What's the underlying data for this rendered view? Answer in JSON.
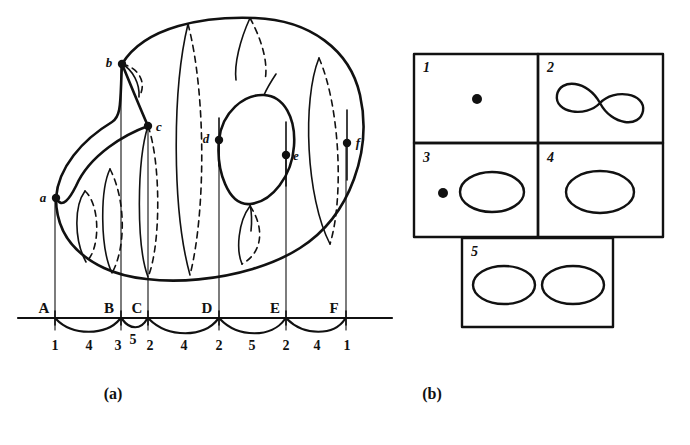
{
  "figure": {
    "panels": [
      {
        "id": "a",
        "caption": "(a)",
        "caption_x": 113,
        "caption_y": 399
      },
      {
        "id": "b",
        "caption": "(b)",
        "caption_x": 432,
        "caption_y": 399
      }
    ]
  },
  "panel_a": {
    "description": "Morse-theory height/height-function diagram of a genus-2 surface with critical points a-f projected onto a horizontal axis divided into intervals A-F.",
    "critical_points": [
      {
        "label": "a",
        "x": 56,
        "y": 198,
        "label_dx": -13,
        "label_dy": 4
      },
      {
        "label": "b",
        "x": 122,
        "y": 64,
        "label_dx": -13,
        "label_dy": 3
      },
      {
        "label": "c",
        "x": 148,
        "y": 126,
        "label_dx": 8,
        "label_dy": 5
      },
      {
        "label": "d",
        "x": 219,
        "y": 140,
        "label_dx": -13,
        "label_dy": 3
      },
      {
        "label": "e",
        "x": 286,
        "y": 155,
        "label_dx": 7,
        "label_dy": 5
      },
      {
        "label": "f",
        "x": 347,
        "y": 143,
        "label_dx": 8,
        "label_dy": 4
      }
    ],
    "axis": {
      "y": 318,
      "x_start": 18,
      "x_end": 392,
      "tick_labels": [
        {
          "text": "A",
          "x": 44,
          "y": 312
        },
        {
          "text": "B",
          "x": 109,
          "y": 312
        },
        {
          "text": "C",
          "x": 153,
          "y": 312
        },
        {
          "text": "D",
          "x": 207,
          "y": 312
        },
        {
          "text": "E",
          "x": 274,
          "y": 312
        },
        {
          "text": "F",
          "x": 334,
          "y": 312
        }
      ],
      "tick_x": [
        55,
        121,
        148,
        219,
        286,
        346
      ],
      "interval_numbers": [
        {
          "text": "1",
          "x": 55,
          "y": 346
        },
        {
          "text": "4",
          "x": 88,
          "y": 346
        },
        {
          "text": "3",
          "x": 118,
          "y": 346
        },
        {
          "text": "5",
          "x": 133,
          "y": 341
        },
        {
          "text": "2",
          "x": 150,
          "y": 346
        },
        {
          "text": "4",
          "x": 184,
          "y": 346
        },
        {
          "text": "2",
          "x": 219,
          "y": 346
        },
        {
          "text": "5",
          "x": 252,
          "y": 346
        },
        {
          "text": "2",
          "x": 286,
          "y": 346
        },
        {
          "text": "4",
          "x": 316,
          "y": 346
        },
        {
          "text": "1",
          "x": 347,
          "y": 346
        }
      ]
    }
  },
  "panel_b": {
    "description": "Table of the five level-set topology types referenced by the interval numbers in panel (a).",
    "cells": [
      {
        "number": "1",
        "type": "point",
        "x": 414,
        "y": 54,
        "w": 124,
        "h": 89
      },
      {
        "number": "2",
        "type": "figure-eight",
        "x": 538,
        "y": 54,
        "w": 125,
        "h": 89
      },
      {
        "number": "3",
        "type": "point-and-circle",
        "x": 414,
        "y": 143,
        "w": 124,
        "h": 94
      },
      {
        "number": "4",
        "type": "circle",
        "x": 538,
        "y": 143,
        "w": 125,
        "h": 94
      },
      {
        "number": "5",
        "type": "two-circles",
        "x": 462,
        "y": 238,
        "w": 151,
        "h": 89
      }
    ]
  },
  "colors": {
    "ink": "#111111",
    "background": "#ffffff"
  }
}
